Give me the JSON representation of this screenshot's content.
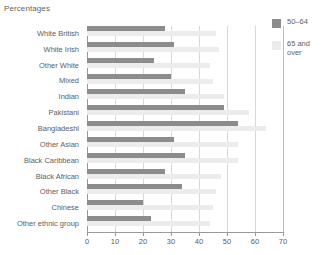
{
  "chart_data": {
    "type": "bar",
    "orientation": "horizontal",
    "title": "Percentages",
    "xlabel": "",
    "ylabel": "",
    "xlim": [
      0,
      70
    ],
    "xticks": [
      0,
      10,
      20,
      30,
      40,
      50,
      60,
      70
    ],
    "grid": true,
    "legend_position": "right",
    "categories": [
      "White British",
      "White Irish",
      "Other White",
      "Mixed",
      "Indian",
      "Pakistani",
      "Bangladeshi",
      "Other Asian",
      "Black Caribbean",
      "Black African",
      "Other Black",
      "Chinese",
      "Other ethnic group"
    ],
    "series": [
      {
        "name": "50–64",
        "color": "#8c8c8c",
        "values": [
          28,
          31,
          24,
          30,
          35,
          49,
          54,
          31,
          35,
          28,
          34,
          20,
          23
        ]
      },
      {
        "name": "65 and over",
        "color": "#ececec",
        "values": [
          46,
          47,
          44,
          45,
          49,
          58,
          64,
          54,
          54,
          48,
          46,
          45,
          44
        ]
      }
    ]
  },
  "legend": {
    "items": [
      {
        "label": "50–64",
        "swatch": "#8c8c8c"
      },
      {
        "label": "65 and\nover",
        "swatch": "#ececec"
      }
    ]
  }
}
